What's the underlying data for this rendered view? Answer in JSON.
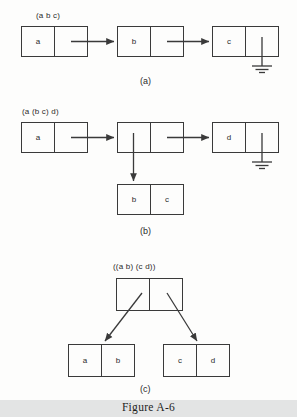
{
  "figure": {
    "caption": "Figure A-6",
    "background_color": "#fdfdfc",
    "band_color": "#e3e4e4",
    "stroke_color": "#3a3a3a",
    "text_color": "#2b2b2b"
  },
  "panels": [
    {
      "id": "a",
      "subcaption": "(a)",
      "list_label": "(a b c)",
      "description": "Flat list cons-cell chain for (a b c) terminating in nil ground symbol",
      "nodes": [
        {
          "name": "node-1",
          "car": "a",
          "cdr": ""
        },
        {
          "name": "node-2",
          "car": "b",
          "cdr": ""
        },
        {
          "name": "node-3",
          "car": "c",
          "cdr": ""
        }
      ],
      "terminator": "ground-nil"
    },
    {
      "id": "b",
      "subcaption": "(b)",
      "list_label": "(a (b c) d)",
      "description": "Nested list cons-cell chain for (a (b c) d); middle node car points down to sublist (b c)",
      "nodes": [
        {
          "name": "node-1",
          "car": "a",
          "cdr": ""
        },
        {
          "name": "node-2",
          "car": "",
          "cdr": ""
        },
        {
          "name": "node-3",
          "car": "d",
          "cdr": ""
        }
      ],
      "sublist": {
        "name": "sublist-node",
        "car": "b",
        "cdr": "c"
      },
      "terminator": "ground-nil"
    },
    {
      "id": "c",
      "subcaption": "(c)",
      "list_label": "((a b) (c d))",
      "description": "Single cons cell whose car and cdr each point to a sublist cell",
      "root": {
        "name": "root-node",
        "car": "",
        "cdr": ""
      },
      "children": [
        {
          "name": "left-sublist",
          "car": "a",
          "cdr": "b"
        },
        {
          "name": "right-sublist",
          "car": "c",
          "cdr": "d"
        }
      ]
    }
  ]
}
